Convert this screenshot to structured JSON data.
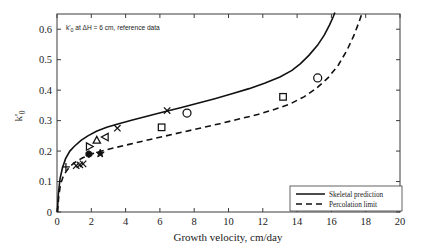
{
  "figure": {
    "annotation": "k'0 at ΔH = 6 cm, reference data",
    "annotation_parts": {
      "symbol": "k'",
      "subscript": "0",
      "rest": " at ΔH = 6 cm, reference data"
    }
  },
  "chart_data": {
    "type": "line",
    "title": "",
    "xlabel": "Growth velocity, cm/day",
    "ylabel": "k'0",
    "ylabel_parts": {
      "symbol": "k'",
      "subscript": "0"
    },
    "xlim": [
      0,
      20
    ],
    "ylim": [
      0,
      0.65
    ],
    "xticks": [
      0,
      2,
      4,
      6,
      8,
      10,
      12,
      14,
      16,
      18,
      20
    ],
    "xticklabels": [
      "0",
      "2",
      "4",
      "6",
      "8",
      "10",
      "12",
      "14",
      "16",
      "18",
      "20"
    ],
    "yticks": [
      0,
      0.1,
      0.2,
      0.3,
      0.4,
      0.5,
      0.6
    ],
    "yticklabels": [
      "0",
      "0.1",
      "0.2",
      "0.3",
      "0.4",
      "0.5",
      "0.6"
    ],
    "grid": false,
    "legend_position": "lower right",
    "series": [
      {
        "name": "Skeletal prediction",
        "style": "solid",
        "color": "#111111",
        "x": [
          0.02,
          0.08,
          0.18,
          0.32,
          0.5,
          0.75,
          1.0,
          1.4,
          1.8,
          2.3,
          2.9,
          3.6,
          4.4,
          5.3,
          6.2,
          7.2,
          8.2,
          9.2,
          10.2,
          11.2,
          12.1,
          13.0,
          13.7,
          14.2,
          14.7,
          15.2,
          15.6,
          15.9,
          16.1,
          16.2
        ],
        "y": [
          0.0,
          0.06,
          0.11,
          0.145,
          0.175,
          0.2,
          0.215,
          0.235,
          0.25,
          0.265,
          0.278,
          0.29,
          0.302,
          0.315,
          0.328,
          0.342,
          0.357,
          0.372,
          0.388,
          0.405,
          0.423,
          0.443,
          0.465,
          0.487,
          0.515,
          0.548,
          0.582,
          0.615,
          0.64,
          0.655
        ]
      },
      {
        "name": "Percolation limit",
        "style": "dashed",
        "color": "#111111",
        "x": [
          0.03,
          0.1,
          0.2,
          0.35,
          0.55,
          0.8,
          1.1,
          1.5,
          2.0,
          2.6,
          3.3,
          4.2,
          5.2,
          6.2,
          7.3,
          8.4,
          9.5,
          10.6,
          11.7,
          12.7,
          13.6,
          14.4,
          15.1,
          15.8,
          16.4,
          16.9,
          17.3,
          17.6,
          17.8
        ],
        "y": [
          0.0,
          0.05,
          0.09,
          0.115,
          0.135,
          0.152,
          0.165,
          0.178,
          0.19,
          0.2,
          0.21,
          0.222,
          0.235,
          0.248,
          0.262,
          0.276,
          0.29,
          0.305,
          0.32,
          0.337,
          0.355,
          0.378,
          0.405,
          0.44,
          0.482,
          0.53,
          0.578,
          0.622,
          0.655
        ]
      }
    ],
    "scatter_points": [
      {
        "marker": "plus",
        "x": 0.52,
        "y": 0.148
      },
      {
        "marker": "x",
        "x": 1.12,
        "y": 0.152
      },
      {
        "marker": "x",
        "x": 1.33,
        "y": 0.155
      },
      {
        "marker": "x",
        "x": 1.52,
        "y": 0.158
      },
      {
        "marker": "hexagon-filled",
        "x": 1.86,
        "y": 0.19
      },
      {
        "marker": "triangle-right",
        "x": 1.88,
        "y": 0.215
      },
      {
        "marker": "triangle-up",
        "x": 2.32,
        "y": 0.235
      },
      {
        "marker": "star-filled",
        "x": 2.52,
        "y": 0.192
      },
      {
        "marker": "triangle-left",
        "x": 2.82,
        "y": 0.246
      },
      {
        "marker": "x",
        "x": 3.52,
        "y": 0.275
      },
      {
        "marker": "square",
        "x": 6.1,
        "y": 0.278
      },
      {
        "marker": "x",
        "x": 6.42,
        "y": 0.333
      },
      {
        "marker": "circle",
        "x": 7.58,
        "y": 0.325
      },
      {
        "marker": "square",
        "x": 13.18,
        "y": 0.378
      },
      {
        "marker": "circle",
        "x": 15.2,
        "y": 0.44
      }
    ],
    "legend": [
      {
        "label": "Skeletal prediction",
        "style": "solid"
      },
      {
        "label": "Percolation limit",
        "style": "dashed"
      }
    ]
  }
}
